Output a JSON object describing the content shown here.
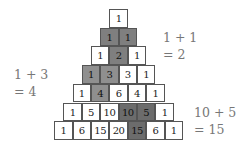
{
  "diagram": {
    "rows": [
      [
        {
          "v": "1",
          "s": 0
        }
      ],
      [
        {
          "v": "1",
          "s": 1
        },
        {
          "v": "1",
          "s": 1
        }
      ],
      [
        {
          "v": "1",
          "s": 0
        },
        {
          "v": "2",
          "s": 1
        },
        {
          "v": "1",
          "s": 0
        }
      ],
      [
        {
          "v": "1",
          "s": 2
        },
        {
          "v": "3",
          "s": 2
        },
        {
          "v": "3",
          "s": 0
        },
        {
          "v": "1",
          "s": 0
        }
      ],
      [
        {
          "v": "1",
          "s": 0
        },
        {
          "v": "4",
          "s": 2
        },
        {
          "v": "6",
          "s": 0
        },
        {
          "v": "4",
          "s": 0
        },
        {
          "v": "1",
          "s": 0
        }
      ],
      [
        {
          "v": "1",
          "s": 0
        },
        {
          "v": "5",
          "s": 0
        },
        {
          "v": "10",
          "s": 0
        },
        {
          "v": "10",
          "s": 3
        },
        {
          "v": "5",
          "s": 3
        },
        {
          "v": "1",
          "s": 0
        }
      ],
      [
        {
          "v": "1",
          "s": 0
        },
        {
          "v": "6",
          "s": 0
        },
        {
          "v": "15",
          "s": 0
        },
        {
          "v": "20",
          "s": 0
        },
        {
          "v": "15",
          "s": 3
        },
        {
          "v": "6",
          "s": 0
        },
        {
          "v": "1",
          "s": 0
        }
      ]
    ],
    "annotations": [
      {
        "line1": "1 + 1",
        "line2": "= 2",
        "x": 163,
        "y": 29
      },
      {
        "line1": "1 + 3",
        "line2": "= 4",
        "x": 14,
        "y": 66
      },
      {
        "line1": "10 + 5",
        "line2": "= 15",
        "x": 194,
        "y": 104
      }
    ],
    "colors": {
      "shade_row2": "#7f7f7f",
      "shade_left": "#8f8f8f",
      "shade_right": "#6c6c6c",
      "border": "#555555",
      "annotation_text": "#777777"
    }
  }
}
